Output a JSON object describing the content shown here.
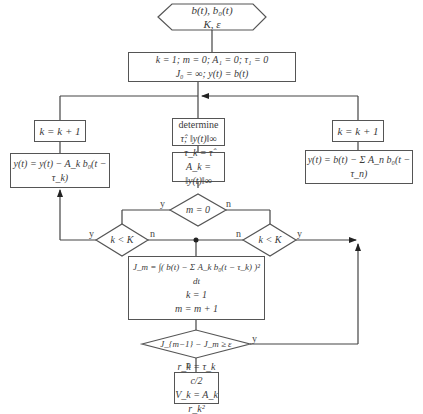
{
  "diagram": {
    "type": "flowchart",
    "nodes": {
      "start": {
        "line1": "b(t),  b₀(t)",
        "line2": "K,  ε"
      },
      "init": {
        "line1": "k = 1;   m = 0;   A₁ = 0;   τ₁ = 0",
        "line2": "J₀ = ∞;   y(t) = b(t)"
      },
      "left_inc": {
        "text": "k = k + 1"
      },
      "left_update": {
        "text": "y(t) = y(t) − A_k b₀(t − τ_k)"
      },
      "determine": {
        "title": "determine",
        "line2": "τ̂;   ‖y(t)‖∞"
      },
      "assign": {
        "line1": "τ_k = τ̂",
        "line2": "A_k = ‖y(t)‖∞"
      },
      "right_inc": {
        "text": "k = k + 1"
      },
      "right_update": {
        "text": "y(t) = b(t) − Σ A_n b₀(t − τ_n)",
        "sum_top": "K",
        "sum_bottom": "n=1, n≠k"
      },
      "m_check": {
        "text": "m = 0"
      },
      "left_kK": {
        "text": "k < K"
      },
      "right_kK": {
        "text": "k < K"
      },
      "J_calc": {
        "line1": "J_m = ∫( b(t) − Σ A_k b₀(t − τ_k) )² dt",
        "sum_top": "K",
        "sum_bottom": "k=1",
        "line2": "k = 1",
        "line3": "m = m + 1"
      },
      "J_check": {
        "text": "J_{m−1} − J_m ≥ ε"
      },
      "result": {
        "line1": "r_k = τ_k c/2",
        "line2": "V_k = A_k r_k²"
      }
    },
    "edge_labels": {
      "m_yes": "y",
      "m_no": "n",
      "left_yes": "y",
      "left_no": "n",
      "right_no": "n",
      "right_yes": "y",
      "J_yes": "y",
      "J_no": "n"
    }
  }
}
